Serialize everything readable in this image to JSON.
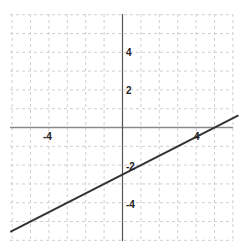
{
  "chart_data": {
    "type": "line",
    "title": "",
    "xlabel": "",
    "ylabel": "",
    "xlim": [
      -6.3,
      6.5
    ],
    "ylim": [
      -6.2,
      6.2
    ],
    "grid": true,
    "grid_step": 1,
    "x_tick_labels": [
      "-4",
      "4"
    ],
    "y_tick_labels": [
      "4",
      "2",
      "-2",
      "-4"
    ],
    "series": [
      {
        "name": "y = 0.5x - 2.5",
        "slope": 0.5,
        "intercept": -2.5,
        "x": [
          -6,
          -4,
          -2,
          0,
          2,
          4,
          6
        ],
        "y": [
          -5.5,
          -4.5,
          -3.5,
          -2.5,
          -1.5,
          -0.5,
          0.5
        ]
      }
    ],
    "colors": {
      "line": "#333333",
      "axis": "#777777",
      "grid": "#cccccc"
    }
  },
  "labels": {
    "x_neg4": "-4",
    "x_pos4": "4",
    "y_pos4": "4",
    "y_pos2": "2",
    "y_neg2": "-2",
    "y_neg4": "-4"
  }
}
